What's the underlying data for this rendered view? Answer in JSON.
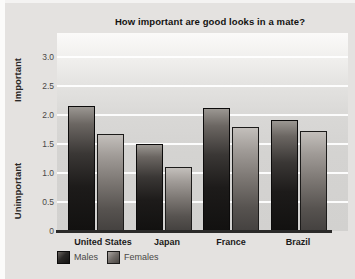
{
  "figure": {
    "title": "How important are good looks in a mate?",
    "y_axis": {
      "label_top": "Important",
      "label_bottom": "Unimportant",
      "ticks": [
        "3.0",
        "2.5",
        "2.0",
        "1.5",
        "1.0",
        "0.5",
        "0"
      ]
    },
    "x_axis": {
      "categories": [
        "United States",
        "Japan",
        "France",
        "Brazil"
      ]
    },
    "legend": {
      "items": [
        "Males",
        "Females"
      ]
    }
  },
  "chart_data": {
    "type": "bar",
    "title": "How important are good looks in a mate?",
    "categories": [
      "United States",
      "Japan",
      "France",
      "Brazil"
    ],
    "series": [
      {
        "name": "Males",
        "values": [
          2.15,
          1.5,
          2.12,
          1.92
        ]
      },
      {
        "name": "Females",
        "values": [
          1.68,
          1.1,
          1.8,
          1.73
        ]
      }
    ],
    "ylim": [
      0,
      3.2
    ],
    "yticks": [
      3.0,
      2.5,
      2.0,
      1.5,
      1.0,
      0.5,
      0
    ],
    "ylabel_top": "Important",
    "ylabel_bottom": "Unimportant",
    "grid": true,
    "gridline_color": "#ffffff",
    "plot_background": "#d9d8d6",
    "page_background": "#e4e2e0",
    "bar_color_males": "#1d1b1a",
    "bar_color_females": "#7b7672",
    "legend_position": "bottom-left"
  }
}
